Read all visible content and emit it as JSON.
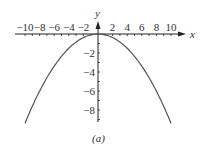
{
  "chart_data": {
    "type": "line",
    "title": "",
    "caption": "(a)",
    "xlabel": "x",
    "ylabel": "y",
    "xlim": [
      -10,
      10
    ],
    "ylim": [
      -9.5,
      0
    ],
    "x_ticks": [
      -10,
      -8,
      -6,
      -4,
      -2,
      2,
      4,
      6,
      8,
      10
    ],
    "y_ticks": [
      -2,
      -4,
      -6,
      -8
    ],
    "series": [
      {
        "name": "y = -x^2/10",
        "x": [
          -10,
          -8,
          -6,
          -4,
          -2,
          0,
          2,
          4,
          6,
          8,
          10
        ],
        "y": [
          -9.4,
          -6.0,
          -3.4,
          -1.5,
          -0.4,
          0,
          -0.4,
          -1.5,
          -3.4,
          -6.0,
          -9.4
        ]
      }
    ],
    "grid": false,
    "legend": null
  },
  "colors": {
    "axis": "#222222",
    "curve": "#555555",
    "text": "#333333"
  }
}
